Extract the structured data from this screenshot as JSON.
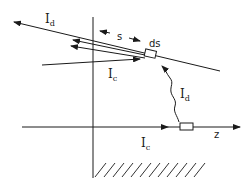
{
  "diagram": {
    "type": "physics-schematic",
    "labels": {
      "direct_current_top": "I",
      "direct_current_top_sub": "d",
      "direct_current_wave": "I",
      "direct_current_wave_sub": "d",
      "crossed_current_upper": "I",
      "crossed_current_upper_sub": "c",
      "crossed_current_lower": "I",
      "crossed_current_lower_sub": "c",
      "separation": "s",
      "element": "ds",
      "axis": "z"
    },
    "colors": {
      "line": "#1a1a1a",
      "background": "#ffffff"
    }
  }
}
